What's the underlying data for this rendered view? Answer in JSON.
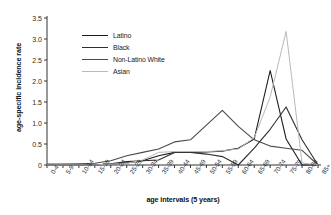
{
  "chart_data": {
    "type": "line",
    "title": "",
    "xlabel": "age intervals (5 years)",
    "ylabel": "age-specific incidence rate",
    "categories": [
      "0-4",
      "5-9",
      "10-14",
      "15-19",
      "20-24",
      "25-29",
      "30-34",
      "35-39",
      "40-44",
      "45-49",
      "50-54",
      "55-59",
      "60-64",
      "65-69",
      "70-74",
      "75-79",
      "80-84",
      "85+"
    ],
    "ylim": [
      0,
      3.5
    ],
    "yticks": [
      "0",
      "0.5",
      "1.0",
      "1.5",
      "2.0",
      "2.5",
      "3.0",
      "3.5"
    ],
    "ytick_values": [
      0,
      0.5,
      1.0,
      1.5,
      2.0,
      2.5,
      3.0,
      3.5
    ],
    "grid": false,
    "legend_position": "upper-center-left",
    "series": [
      {
        "name": "Latino",
        "color": "#1a1a1a",
        "values": [
          0,
          0,
          0,
          0,
          0.02,
          0.05,
          0.1,
          0.22,
          0.3,
          0.3,
          0.31,
          0.33,
          0.4,
          0.62,
          2.25,
          0.62,
          0.0,
          0.0
        ]
      },
      {
        "name": "Black",
        "color": "#2e2e2e",
        "values": [
          0,
          0,
          0,
          0,
          0.03,
          0.08,
          0.1,
          0.12,
          0.3,
          0.3,
          0.26,
          0.2,
          0.0,
          0.4,
          0.85,
          1.38,
          0.6,
          0.0
        ]
      },
      {
        "name": "Non-Latino White",
        "color": "#4a4a4a",
        "values": [
          0.02,
          0.02,
          0.03,
          0.04,
          0.1,
          0.22,
          0.3,
          0.38,
          0.55,
          0.6,
          0.95,
          1.3,
          0.92,
          0.6,
          0.45,
          0.4,
          0.35,
          0.0
        ]
      },
      {
        "name": "Asian",
        "color": "#b9b9b9",
        "values": [
          0,
          0,
          0,
          0,
          0.02,
          0.04,
          0.12,
          0.3,
          0.32,
          0.32,
          0.32,
          0.34,
          0.38,
          0.65,
          1.62,
          3.18,
          0.05,
          0.0
        ]
      }
    ]
  },
  "legend": {
    "items": [
      {
        "label": "Latino"
      },
      {
        "label": "Black"
      },
      {
        "label": "Non-Latino White"
      },
      {
        "label": "Asian"
      }
    ]
  }
}
